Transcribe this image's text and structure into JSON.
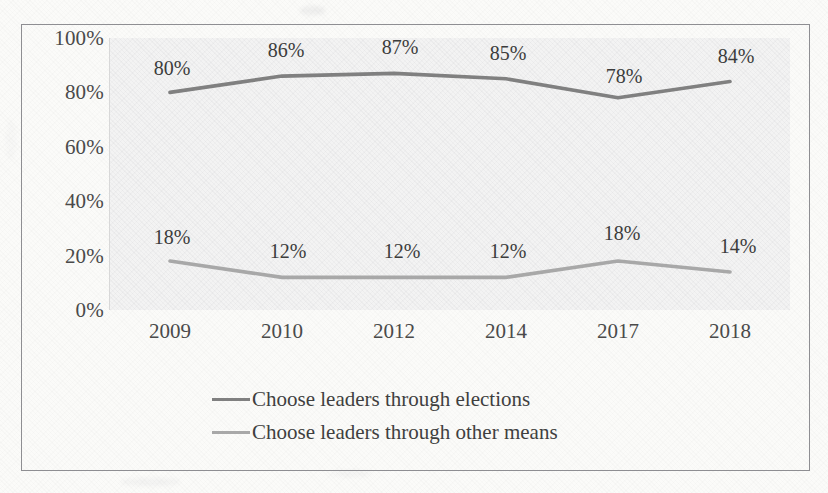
{
  "chart_data": {
    "type": "line",
    "title": "",
    "subtitle": "",
    "xlabel": "",
    "ylabel": "",
    "categories": [
      "2009",
      "2010",
      "2012",
      "2014",
      "2017",
      "2018"
    ],
    "ylim": [
      0,
      100
    ],
    "y_ticks": [
      "0%",
      "20%",
      "40%",
      "60%",
      "80%",
      "100%"
    ],
    "y_tick_values": [
      0,
      20,
      40,
      60,
      80,
      100
    ],
    "grid": false,
    "legend_position": "bottom",
    "series": [
      {
        "name": "Choose leaders through elections",
        "color": "#808080",
        "values": [
          80,
          86,
          87,
          85,
          78,
          84
        ],
        "labels": [
          "80%",
          "86%",
          "87%",
          "85%",
          "78%",
          "84%"
        ]
      },
      {
        "name": "Choose leaders through other means",
        "color": "#a8a8a8",
        "values": [
          18,
          12,
          12,
          12,
          18,
          14
        ],
        "labels": [
          "18%",
          "12%",
          "12%",
          "12%",
          "18%",
          "14%"
        ]
      }
    ]
  },
  "legend": {
    "items": [
      {
        "label": "Choose leaders through elections",
        "color": "#808080"
      },
      {
        "label": "Choose leaders through other means",
        "color": "#a8a8a8"
      }
    ]
  },
  "colors": {
    "series_primary": "#808080",
    "series_secondary": "#a8a8a8",
    "frame": "#8e8e92",
    "plot_background": "#f3f3f3",
    "page_background": "#fbfbf9",
    "text": "#4a4a4a"
  }
}
